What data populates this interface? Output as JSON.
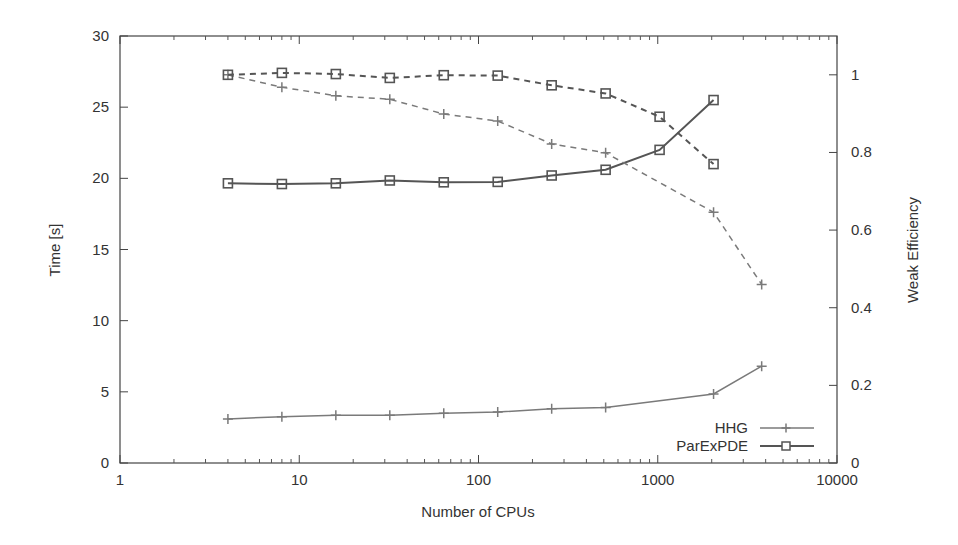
{
  "chart_data": {
    "type": "line",
    "title": "",
    "xlabel": "Number of CPUs",
    "ylabel": "Time [s]",
    "y2label": "Weak Efficiency",
    "xscale": "log",
    "xlim": [
      1,
      10000
    ],
    "ylim": [
      0,
      30
    ],
    "y2lim": [
      0,
      1.1
    ],
    "grid": false,
    "legend_position": "bottom-right",
    "x_ticks": [
      1,
      10,
      100,
      1000,
      10000
    ],
    "x_tick_labels": [
      "1",
      "10",
      "100",
      "1000",
      "10000"
    ],
    "y_ticks": [
      0,
      5,
      10,
      15,
      20,
      25,
      30
    ],
    "y_tick_labels": [
      "0",
      "5",
      "10",
      "15",
      "20",
      "25",
      "30"
    ],
    "y2_ticks": [
      0,
      0.2,
      0.4,
      0.6,
      0.8,
      1
    ],
    "y2_tick_labels": [
      "0",
      "0.2",
      "0.4",
      "0.6",
      "0.8",
      "1"
    ],
    "series": [
      {
        "name": "HHG",
        "axis": "y",
        "style": "solid",
        "marker": "plus",
        "color": "#7a7a7a",
        "in_legend": true,
        "x": [
          4,
          8,
          16,
          32,
          64,
          128,
          256,
          512,
          2048,
          3800
        ],
        "values": [
          3.1,
          3.25,
          3.35,
          3.35,
          3.5,
          3.58,
          3.81,
          3.9,
          4.85,
          6.8
        ]
      },
      {
        "name": "ParExPDE",
        "axis": "y",
        "style": "solid",
        "marker": "square",
        "color": "#555555",
        "in_legend": true,
        "x": [
          4,
          8,
          16,
          32,
          64,
          128,
          256,
          512,
          1024,
          2048
        ],
        "values": [
          19.65,
          19.6,
          19.65,
          19.85,
          19.72,
          19.75,
          20.2,
          20.6,
          22.0,
          25.5
        ]
      },
      {
        "name": "HHG efficiency",
        "axis": "y2",
        "style": "dashed",
        "marker": "plus",
        "color": "#7a7a7a",
        "in_legend": false,
        "x": [
          4,
          8,
          16,
          32,
          64,
          128,
          256,
          512,
          2048,
          3800
        ],
        "values": [
          1.0,
          0.968,
          0.946,
          0.937,
          0.899,
          0.881,
          0.822,
          0.799,
          0.646,
          0.46
        ]
      },
      {
        "name": "ParExPDE efficiency",
        "axis": "y2",
        "style": "dashed",
        "marker": "square",
        "color": "#555555",
        "in_legend": false,
        "x": [
          4,
          8,
          16,
          32,
          64,
          128,
          256,
          512,
          1024,
          2048
        ],
        "values": [
          1.0,
          1.005,
          1.002,
          0.992,
          0.999,
          0.998,
          0.973,
          0.952,
          0.892,
          0.77
        ]
      }
    ]
  }
}
